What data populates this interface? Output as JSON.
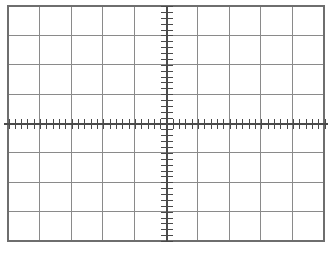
{
  "chart_data": {
    "type": "table",
    "title": "",
    "subtitle": "",
    "xlabel": "",
    "ylabel": "",
    "grid": {
      "on": true,
      "columns": 10,
      "rows": 8,
      "xlim": [
        -5,
        5
      ],
      "ylim": [
        -4,
        4
      ],
      "x_division_values": [
        -5,
        -4,
        -3,
        -2,
        -1,
        0,
        1,
        2,
        3,
        4,
        5
      ],
      "y_division_values": [
        -4,
        -3,
        -2,
        -1,
        0,
        1,
        2,
        3,
        4
      ]
    },
    "axes": {
      "horizontal_axis_y_value": 0,
      "vertical_axis_x_value": 0,
      "minor_ticks_per_division": 5,
      "horizontal_axis_total_minor_ticks": 50,
      "vertical_axis_total_minor_ticks": 40
    },
    "series": [],
    "values": [],
    "categories": [],
    "tick_labels": {
      "x": [],
      "y": []
    },
    "legend": {
      "entries": [],
      "position": "none"
    },
    "annotations": []
  },
  "canvas": {
    "width": 334,
    "height": 259,
    "background_color": "#ffffff"
  },
  "graticule": {
    "name": "oscilloscope-graticule",
    "border_color": "#6e6e6e",
    "gridline_color": "#8a8a8a",
    "axis_color": "#4a4a4a",
    "tick_color": "#4a4a4a",
    "border_width_px": 1.2,
    "gridline_width_px": 1.0,
    "axis_width_px": 1.2,
    "tick_width_px": 1.0,
    "geometry": {
      "left_px": 8,
      "top_px": 6,
      "right_px": 324,
      "bottom_px": 241,
      "center_x_px": 167,
      "center_y_px": 124,
      "cell_width_px": 31.6,
      "cell_height_px": 29.375,
      "horizontal_tick_half_length_px": 5,
      "vertical_tick_half_length_px": 6,
      "axis_overhang_px": 4
    }
  }
}
